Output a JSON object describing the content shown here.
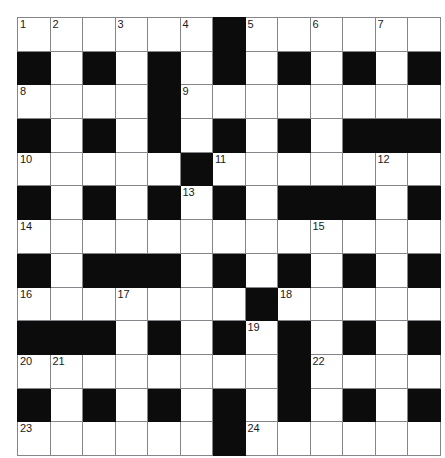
{
  "puzzle": {
    "title": "Crossword Grid",
    "type": "crossword",
    "rows": 13,
    "cols": 13,
    "colors": {
      "block": "#0c0c0c",
      "cell": "#ffffff",
      "gridline": "#86868a",
      "number_text": "#1a1a1a"
    },
    "legend": {
      "block_label": "blocked-square",
      "open_label": "open-square"
    },
    "clue_numbers_present": [
      1,
      2,
      3,
      4,
      5,
      6,
      7,
      8,
      9,
      10,
      11,
      12,
      13,
      14,
      15,
      16,
      17,
      18,
      19,
      20,
      21,
      22,
      23,
      24
    ],
    "grid": [
      [
        {
          "block": false,
          "num": "1"
        },
        {
          "block": false,
          "num": "2"
        },
        {
          "block": false,
          "num": ""
        },
        {
          "block": false,
          "num": "3"
        },
        {
          "block": false,
          "num": ""
        },
        {
          "block": false,
          "num": "4"
        },
        {
          "block": true,
          "num": ""
        },
        {
          "block": false,
          "num": "5"
        },
        {
          "block": false,
          "num": ""
        },
        {
          "block": false,
          "num": "6"
        },
        {
          "block": false,
          "num": ""
        },
        {
          "block": false,
          "num": "7"
        },
        {
          "block": false,
          "num": ""
        }
      ],
      [
        {
          "block": true,
          "num": ""
        },
        {
          "block": false,
          "num": ""
        },
        {
          "block": true,
          "num": ""
        },
        {
          "block": false,
          "num": ""
        },
        {
          "block": true,
          "num": ""
        },
        {
          "block": false,
          "num": ""
        },
        {
          "block": true,
          "num": ""
        },
        {
          "block": false,
          "num": ""
        },
        {
          "block": true,
          "num": ""
        },
        {
          "block": false,
          "num": ""
        },
        {
          "block": true,
          "num": ""
        },
        {
          "block": false,
          "num": ""
        },
        {
          "block": true,
          "num": ""
        }
      ],
      [
        {
          "block": false,
          "num": "8"
        },
        {
          "block": false,
          "num": ""
        },
        {
          "block": false,
          "num": ""
        },
        {
          "block": false,
          "num": ""
        },
        {
          "block": true,
          "num": ""
        },
        {
          "block": false,
          "num": "9"
        },
        {
          "block": false,
          "num": ""
        },
        {
          "block": false,
          "num": ""
        },
        {
          "block": false,
          "num": ""
        },
        {
          "block": false,
          "num": ""
        },
        {
          "block": false,
          "num": ""
        },
        {
          "block": false,
          "num": ""
        },
        {
          "block": false,
          "num": ""
        }
      ],
      [
        {
          "block": true,
          "num": ""
        },
        {
          "block": false,
          "num": ""
        },
        {
          "block": true,
          "num": ""
        },
        {
          "block": false,
          "num": ""
        },
        {
          "block": true,
          "num": ""
        },
        {
          "block": false,
          "num": ""
        },
        {
          "block": true,
          "num": ""
        },
        {
          "block": false,
          "num": ""
        },
        {
          "block": true,
          "num": ""
        },
        {
          "block": false,
          "num": ""
        },
        {
          "block": true,
          "num": ""
        },
        {
          "block": true,
          "num": ""
        },
        {
          "block": true,
          "num": ""
        }
      ],
      [
        {
          "block": false,
          "num": "10"
        },
        {
          "block": false,
          "num": ""
        },
        {
          "block": false,
          "num": ""
        },
        {
          "block": false,
          "num": ""
        },
        {
          "block": false,
          "num": ""
        },
        {
          "block": true,
          "num": ""
        },
        {
          "block": false,
          "num": "11"
        },
        {
          "block": false,
          "num": ""
        },
        {
          "block": false,
          "num": ""
        },
        {
          "block": false,
          "num": ""
        },
        {
          "block": false,
          "num": ""
        },
        {
          "block": false,
          "num": "12"
        },
        {
          "block": false,
          "num": ""
        }
      ],
      [
        {
          "block": true,
          "num": ""
        },
        {
          "block": false,
          "num": ""
        },
        {
          "block": true,
          "num": ""
        },
        {
          "block": false,
          "num": ""
        },
        {
          "block": true,
          "num": ""
        },
        {
          "block": false,
          "num": "13"
        },
        {
          "block": true,
          "num": ""
        },
        {
          "block": false,
          "num": ""
        },
        {
          "block": true,
          "num": ""
        },
        {
          "block": true,
          "num": ""
        },
        {
          "block": true,
          "num": ""
        },
        {
          "block": false,
          "num": ""
        },
        {
          "block": true,
          "num": ""
        }
      ],
      [
        {
          "block": false,
          "num": "14"
        },
        {
          "block": false,
          "num": ""
        },
        {
          "block": false,
          "num": ""
        },
        {
          "block": false,
          "num": ""
        },
        {
          "block": false,
          "num": ""
        },
        {
          "block": false,
          "num": ""
        },
        {
          "block": false,
          "num": ""
        },
        {
          "block": false,
          "num": ""
        },
        {
          "block": false,
          "num": ""
        },
        {
          "block": false,
          "num": "15"
        },
        {
          "block": false,
          "num": ""
        },
        {
          "block": false,
          "num": ""
        },
        {
          "block": false,
          "num": ""
        }
      ],
      [
        {
          "block": true,
          "num": ""
        },
        {
          "block": false,
          "num": ""
        },
        {
          "block": true,
          "num": ""
        },
        {
          "block": true,
          "num": ""
        },
        {
          "block": true,
          "num": ""
        },
        {
          "block": false,
          "num": ""
        },
        {
          "block": true,
          "num": ""
        },
        {
          "block": false,
          "num": ""
        },
        {
          "block": true,
          "num": ""
        },
        {
          "block": false,
          "num": ""
        },
        {
          "block": true,
          "num": ""
        },
        {
          "block": false,
          "num": ""
        },
        {
          "block": true,
          "num": ""
        }
      ],
      [
        {
          "block": false,
          "num": "16"
        },
        {
          "block": false,
          "num": ""
        },
        {
          "block": false,
          "num": ""
        },
        {
          "block": false,
          "num": "17"
        },
        {
          "block": false,
          "num": ""
        },
        {
          "block": false,
          "num": ""
        },
        {
          "block": false,
          "num": ""
        },
        {
          "block": true,
          "num": ""
        },
        {
          "block": false,
          "num": "18"
        },
        {
          "block": false,
          "num": ""
        },
        {
          "block": false,
          "num": ""
        },
        {
          "block": false,
          "num": ""
        },
        {
          "block": false,
          "num": ""
        }
      ],
      [
        {
          "block": true,
          "num": ""
        },
        {
          "block": true,
          "num": ""
        },
        {
          "block": true,
          "num": ""
        },
        {
          "block": false,
          "num": ""
        },
        {
          "block": true,
          "num": ""
        },
        {
          "block": false,
          "num": ""
        },
        {
          "block": true,
          "num": ""
        },
        {
          "block": false,
          "num": "19"
        },
        {
          "block": true,
          "num": ""
        },
        {
          "block": false,
          "num": ""
        },
        {
          "block": true,
          "num": ""
        },
        {
          "block": false,
          "num": ""
        },
        {
          "block": true,
          "num": ""
        }
      ],
      [
        {
          "block": false,
          "num": "20"
        },
        {
          "block": false,
          "num": "21"
        },
        {
          "block": false,
          "num": ""
        },
        {
          "block": false,
          "num": ""
        },
        {
          "block": false,
          "num": ""
        },
        {
          "block": false,
          "num": ""
        },
        {
          "block": false,
          "num": ""
        },
        {
          "block": false,
          "num": ""
        },
        {
          "block": true,
          "num": ""
        },
        {
          "block": false,
          "num": "22"
        },
        {
          "block": false,
          "num": ""
        },
        {
          "block": false,
          "num": ""
        },
        {
          "block": false,
          "num": ""
        }
      ],
      [
        {
          "block": true,
          "num": ""
        },
        {
          "block": false,
          "num": ""
        },
        {
          "block": true,
          "num": ""
        },
        {
          "block": false,
          "num": ""
        },
        {
          "block": true,
          "num": ""
        },
        {
          "block": false,
          "num": ""
        },
        {
          "block": true,
          "num": ""
        },
        {
          "block": false,
          "num": ""
        },
        {
          "block": true,
          "num": ""
        },
        {
          "block": false,
          "num": ""
        },
        {
          "block": true,
          "num": ""
        },
        {
          "block": false,
          "num": ""
        },
        {
          "block": true,
          "num": ""
        }
      ],
      [
        {
          "block": false,
          "num": "23"
        },
        {
          "block": false,
          "num": ""
        },
        {
          "block": false,
          "num": ""
        },
        {
          "block": false,
          "num": ""
        },
        {
          "block": false,
          "num": ""
        },
        {
          "block": false,
          "num": ""
        },
        {
          "block": true,
          "num": ""
        },
        {
          "block": false,
          "num": "24"
        },
        {
          "block": false,
          "num": ""
        },
        {
          "block": false,
          "num": ""
        },
        {
          "block": false,
          "num": ""
        },
        {
          "block": false,
          "num": ""
        },
        {
          "block": false,
          "num": ""
        }
      ]
    ]
  }
}
